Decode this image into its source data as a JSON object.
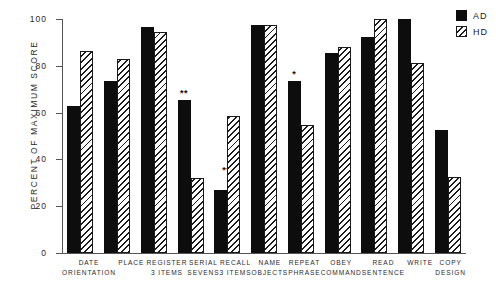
{
  "chart_data": {
    "type": "bar",
    "title": "",
    "subtitle": "",
    "xlabel": "",
    "ylabel": "PERCENT OF MAXIMUM SCORE",
    "ylim": [
      0,
      100
    ],
    "yticks": [
      0,
      20,
      40,
      60,
      80,
      100
    ],
    "ytick_labels": [
      "0",
      "20",
      "40",
      "60",
      "80",
      "100"
    ],
    "grid": false,
    "legend_position": "top-right",
    "categories": [
      "DATE ORIENTATION",
      "PLACE",
      "REGISTER 3 ITEMS",
      "SERIAL SEVENS",
      "RECALL 3 ITEMS",
      "NAME OBJECTS",
      "REPEAT PHRASE",
      "OBEY COMMAND",
      "READ SENTENCE",
      "WRITE SENTENCE",
      "COPY DESIGN"
    ],
    "category_lines": [
      [
        "DATE",
        "ORIENTATION"
      ],
      [
        "PLACE",
        ""
      ],
      [
        "REGISTER",
        "3 ITEMS"
      ],
      [
        "SERIAL",
        "SEVENS"
      ],
      [
        "RECALL",
        "3 ITEMS"
      ],
      [
        "NAME",
        "OBJECTS"
      ],
      [
        "REPEAT",
        "PHRASE"
      ],
      [
        "OBEY",
        "COMMAND"
      ],
      [
        "READ",
        "SENTENCE"
      ],
      [
        "WRITE",
        ""
      ],
      [
        "COPY",
        "DESIGN"
      ]
    ],
    "series": [
      {
        "name": "AD",
        "color": "#0d0d0d",
        "fill": "solid",
        "values": [
          63,
          73.5,
          96.5,
          65.5,
          27,
          97.5,
          73.5,
          85.5,
          92.5,
          100,
          52.5
        ]
      },
      {
        "name": "HD",
        "color": "#1a1a1a",
        "fill": "hatched",
        "values": [
          86.5,
          83,
          94.5,
          32,
          58.5,
          97.5,
          54.5,
          88,
          100,
          81,
          32.5
        ]
      }
    ],
    "annotations": [
      "**",
      "",
      "",
      "**",
      "**",
      "",
      "*",
      "",
      "",
      "",
      ""
    ]
  },
  "legend": {
    "items": [
      {
        "label": "AD",
        "swatch": "solid-black"
      },
      {
        "label": "HD",
        "swatch": "hatched"
      }
    ]
  }
}
